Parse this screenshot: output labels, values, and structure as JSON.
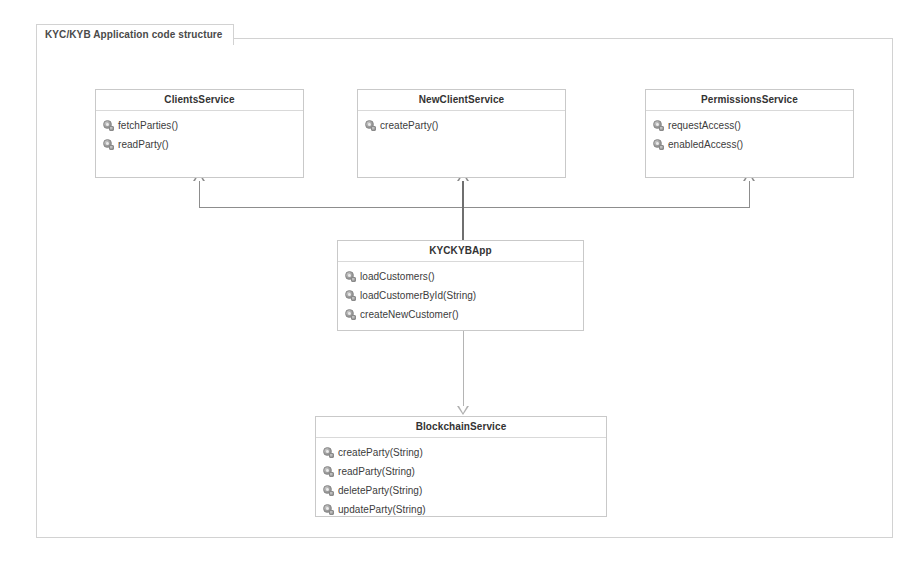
{
  "frame": {
    "label": "KYC/KYB Application code structure"
  },
  "method_icon_name": "method-icon",
  "classes": [
    {
      "id": "clients-service",
      "name": "ClientsService",
      "methods": [
        "fetchParties()",
        "readParty()"
      ]
    },
    {
      "id": "new-client-service",
      "name": "NewClientService",
      "methods": [
        "createParty()"
      ]
    },
    {
      "id": "permissions-service",
      "name": "PermissionsService",
      "methods": [
        "requestAccess()",
        "enabledAccess()"
      ]
    },
    {
      "id": "kyckybapp",
      "name": "KYCKYBApp",
      "methods": [
        "loadCustomers()",
        "loadCustomerById(String)",
        "createNewCustomer()"
      ]
    },
    {
      "id": "blockchain-service",
      "name": "BlockchainService",
      "methods": [
        "createParty(String)",
        "readParty(String)",
        "deleteParty(String)",
        "updateParty(String)"
      ]
    }
  ],
  "relationships": [
    {
      "id": "kyckybapp-to-clients-service",
      "type": "generalization",
      "from": "KYCKYBApp",
      "to": "ClientsService"
    },
    {
      "id": "kyckybapp-to-new-client-service",
      "type": "generalization",
      "from": "KYCKYBApp",
      "to": "NewClientService"
    },
    {
      "id": "kyckybapp-to-permissions-service",
      "type": "generalization",
      "from": "KYCKYBApp",
      "to": "PermissionsService"
    },
    {
      "id": "kyckybapp-to-blockchain-service",
      "type": "generalization",
      "from": "KYCKYBApp",
      "to": "BlockchainService"
    }
  ],
  "colors": {
    "background": "#ffffff",
    "frame_border": "#d2d2d2",
    "class_border": "#c9c9c9",
    "connector": "#8d8d8d",
    "title_text": "#333333",
    "member_text": "#3c3c3c"
  }
}
